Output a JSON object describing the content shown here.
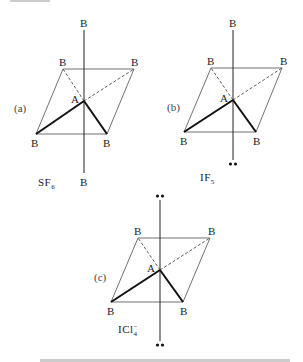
{
  "figure": {
    "panels": [
      {
        "id": "a",
        "label": "(a)",
        "formula": "SF",
        "formula_sub": "6",
        "formula_sup": "",
        "center_atom": "A",
        "ligand": "B",
        "top_position": "B",
        "bottom_position": "B",
        "lone_pairs": 0
      },
      {
        "id": "b",
        "label": "(b)",
        "formula": "IF",
        "formula_sub": "5",
        "formula_sup": "",
        "center_atom": "A",
        "ligand": "B",
        "top_position": "B",
        "bottom_position": "••",
        "lone_pairs": 1
      },
      {
        "id": "c",
        "label": "(c)",
        "formula": "ICl",
        "formula_sub": "4",
        "formula_sup": "−",
        "center_atom": "A",
        "ligand": "B",
        "top_position": "••",
        "bottom_position": "••",
        "lone_pairs": 2
      }
    ],
    "lone_pair_glyph": "••"
  }
}
